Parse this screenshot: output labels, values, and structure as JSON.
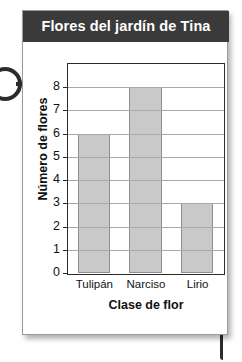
{
  "card": {
    "title": "Flores del jardín de Tina"
  },
  "decorations": {
    "ring_left": "ring-icon",
    "ring_left_connector": "connector-line",
    "tail_bottom_right": "connector-line"
  },
  "colors": {
    "title_bar": "#3a3a3a",
    "title_text": "#ffffff",
    "bar_fill": "#c9c9c9",
    "bar_stroke": "#8e8e8e",
    "gridline": "#a8a8a8",
    "axis": "#2b2b2b",
    "card_background": "#ffffff"
  },
  "chart_data": {
    "type": "bar",
    "title": "Flores del jardín de Tina",
    "categories": [
      "Tulipán",
      "Narciso",
      "Lirio"
    ],
    "values": [
      6,
      8,
      3
    ],
    "xlabel": "Clase de flor",
    "ylabel": "Número de flores",
    "ylim": [
      0,
      9
    ],
    "yticks": [
      0,
      1,
      2,
      3,
      4,
      5,
      6,
      7,
      8
    ],
    "ytick_labels": [
      "0",
      "1",
      "2",
      "3",
      "4",
      "5",
      "6",
      "7",
      "8"
    ],
    "grid": true,
    "grid_axis": "y",
    "legend": false
  }
}
